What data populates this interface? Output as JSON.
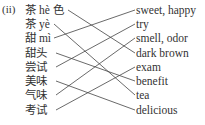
{
  "exercise_label": "(ii)",
  "left_items": [
    {
      "text": "茶 hè 色",
      "y": 3
    },
    {
      "text": "茶 yè",
      "y": 17
    },
    {
      "text": "甜 mì",
      "y": 31
    },
    {
      "text": "甜头",
      "y": 46
    },
    {
      "text": "尝试",
      "y": 60
    },
    {
      "text": "美味",
      "y": 74
    },
    {
      "text": "气味",
      "y": 88
    },
    {
      "text": "考试",
      "y": 103
    }
  ],
  "right_items": [
    {
      "text": "sweet, happy",
      "y": 3
    },
    {
      "text": "try",
      "y": 17
    },
    {
      "text": "smell, odor",
      "y": 31
    },
    {
      "text": "dark brown",
      "y": 46
    },
    {
      "text": "exam",
      "y": 60
    },
    {
      "text": "benefit",
      "y": 74
    },
    {
      "text": "tea",
      "y": 88
    },
    {
      "text": "delicious",
      "y": 103
    }
  ],
  "matches": [
    {
      "left": 0,
      "right": 3
    },
    {
      "left": 1,
      "right": 6
    },
    {
      "left": 2,
      "right": 0
    },
    {
      "left": 3,
      "right": 5
    },
    {
      "left": 4,
      "right": 1
    },
    {
      "left": 5,
      "right": 7
    },
    {
      "left": 6,
      "right": 2
    },
    {
      "left": 7,
      "right": 4
    }
  ],
  "line_color": "#444444"
}
